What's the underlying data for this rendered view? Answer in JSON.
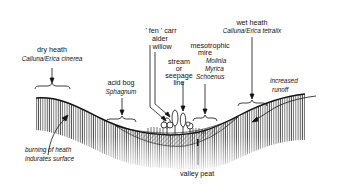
{
  "diagram": {
    "type": "cross-section",
    "labels": {
      "dry_heath": {
        "title": "dry heath",
        "species": "Calluna/Erica cinerea"
      },
      "acid_bog": {
        "title": "acid bog",
        "species": "Sphagnum"
      },
      "fen_carr": {
        "line1": "' fen ' carr",
        "line2": "alder",
        "line3": "willow"
      },
      "stream": {
        "line1": "stream",
        "line2": "or",
        "line3": "seepage",
        "line4": "line"
      },
      "mesotrophic_mire": {
        "line1": "mesotrophic",
        "line2": "mire",
        "species1": "Molinia",
        "species2": "Myrica",
        "species3": "Schoenus"
      },
      "wet_heath": {
        "title": "wet heath",
        "species": "Calluna/Erica tetralix"
      },
      "increased_runoff": {
        "line1": "increased",
        "line2": "runoff"
      },
      "burning": {
        "line1": "burning of heath",
        "line2": "indurates surface"
      },
      "valley_peat": "valley peat"
    },
    "colors": {
      "ink": "#111111",
      "background": "#ffffff",
      "hatch": "#555555"
    }
  }
}
